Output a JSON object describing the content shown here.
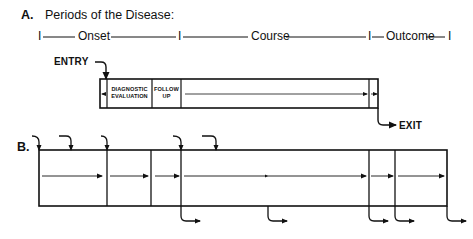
{
  "section_a": {
    "label": "A.",
    "title": "Periods of the Disease:",
    "timeline": {
      "marker": "I",
      "onset": "Onset",
      "course": "Course",
      "outcome": "Outcome"
    },
    "entry_label": "ENTRY",
    "exit_label": "EXIT",
    "cells": {
      "diagnostic_line1": "DIAGNOSTIC",
      "diagnostic_line2": "EVALUATION",
      "followup_line1": "FOLLOW",
      "followup_line2": "UP"
    }
  },
  "section_b": {
    "label": "B.",
    "entry_arrow_count": 5,
    "exit_arrow_count": 5
  },
  "colors": {
    "ink": "#111111",
    "background": "#ffffff"
  }
}
